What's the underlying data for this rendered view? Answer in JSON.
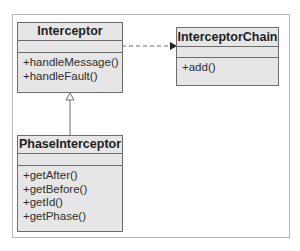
{
  "diagram": {
    "type": "uml-class-diagram",
    "classes": [
      {
        "name": "Interceptor",
        "attributes": [],
        "operations": [
          "+handleMessage()",
          "+handleFault()"
        ]
      },
      {
        "name": "InterceptorChain",
        "attributes": [],
        "operations": [
          "+add()"
        ]
      },
      {
        "name": "PhaseInterceptor",
        "attributes": [],
        "operations": [
          "+getAfter()",
          "+getBefore()",
          "+getId()",
          "+getPhase()"
        ]
      }
    ],
    "relations": [
      {
        "from": "Interceptor",
        "to": "InterceptorChain",
        "kind": "dependency",
        "style": "dashed-arrow"
      },
      {
        "from": "PhaseInterceptor",
        "to": "Interceptor",
        "kind": "generalization",
        "style": "hollow-triangle"
      }
    ]
  },
  "colors": {
    "box_fill": "#e6e6e6",
    "box_border": "#6d6d6d",
    "frame_border": "#b8b8b8",
    "connector": "#555555"
  }
}
